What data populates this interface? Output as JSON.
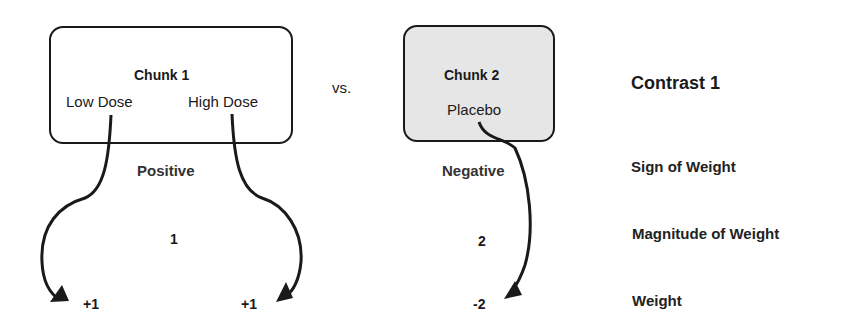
{
  "chunk1": {
    "title": "Chunk 1",
    "items": [
      "Low Dose",
      "High Dose"
    ],
    "sign": "Positive",
    "magnitude": "1",
    "weights": [
      "+1",
      "+1"
    ]
  },
  "versus": "vs.",
  "chunk2": {
    "title": "Chunk 2",
    "items": [
      "Placebo"
    ],
    "sign": "Negative",
    "magnitude": "2",
    "weights": [
      "-2"
    ]
  },
  "legend": {
    "title": "Contrast 1",
    "sign_label": "Sign of Weight",
    "magnitude_label": "Magnitude of Weight",
    "weight_label": "Weight"
  },
  "colors": {
    "line": "#1a1a1a",
    "chunk2_fill": "#e6e6e6"
  }
}
